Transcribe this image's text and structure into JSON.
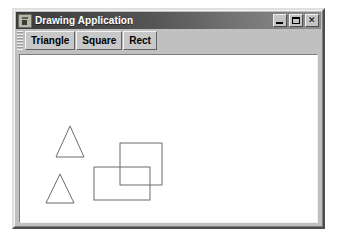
{
  "window": {
    "title": "Drawing Application",
    "icon": "java-app-icon",
    "controls": [
      {
        "name": "minimize-button",
        "glyph": "_",
        "tooltip": "Minimize"
      },
      {
        "name": "maximize-button",
        "glyph": "□",
        "tooltip": "Maximize"
      },
      {
        "name": "close-button",
        "glyph": "✕",
        "tooltip": "Close"
      }
    ]
  },
  "toolbar": {
    "grip": "drag-handle",
    "buttons": [
      {
        "name": "triangle-button",
        "label": "Triangle"
      },
      {
        "name": "square-button",
        "label": "Square"
      },
      {
        "name": "rect-button",
        "label": "Rect"
      }
    ]
  },
  "canvas": {
    "background": "#ffffff",
    "stroke": "#6b6b6b",
    "stroke_width": 1,
    "width": 297,
    "height": 167,
    "shapes": [
      {
        "name": "triangle-1",
        "type": "triangle",
        "points": "50,71 36,102 64,102"
      },
      {
        "name": "triangle-2",
        "type": "triangle",
        "points": "40,119 26,148 54,148"
      },
      {
        "name": "square-1",
        "type": "square",
        "x": 100,
        "y": 88,
        "width": 42,
        "height": 42
      },
      {
        "name": "rect-1",
        "type": "rect",
        "x": 74,
        "y": 112,
        "width": 56,
        "height": 33
      }
    ]
  }
}
